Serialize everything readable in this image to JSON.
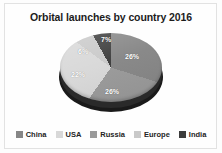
{
  "chart_data": {
    "type": "pie",
    "title": "Orbital launches by country 2016",
    "categories": [
      "China",
      "USA",
      "Russia",
      "Europe",
      "India"
    ],
    "values": [
      26,
      22,
      26,
      6,
      7
    ],
    "data_labels": [
      "26%",
      "22%",
      "26%",
      "6%",
      "7%"
    ],
    "colors": [
      "#878787",
      "#d8d8d8",
      "#9a9a9a",
      "#c9c9c9",
      "#3c3c3c"
    ],
    "units": "percent",
    "legend_position": "bottom",
    "grid": false,
    "xlabel": "",
    "ylabel": "",
    "style": "3d-pie-grayscale"
  },
  "legend": {
    "items": [
      {
        "label": "China",
        "color": "#878787"
      },
      {
        "label": "USA",
        "color": "#d8d8d8"
      },
      {
        "label": "Russia",
        "color": "#9a9a9a"
      },
      {
        "label": "Europe",
        "color": "#c9c9c9"
      },
      {
        "label": "India",
        "color": "#3c3c3c"
      }
    ]
  },
  "theme": {
    "background": "#fdfdfd",
    "border": "#e2e2e2",
    "title_color": "#1c1c1c",
    "label_color": "#ffffff"
  }
}
